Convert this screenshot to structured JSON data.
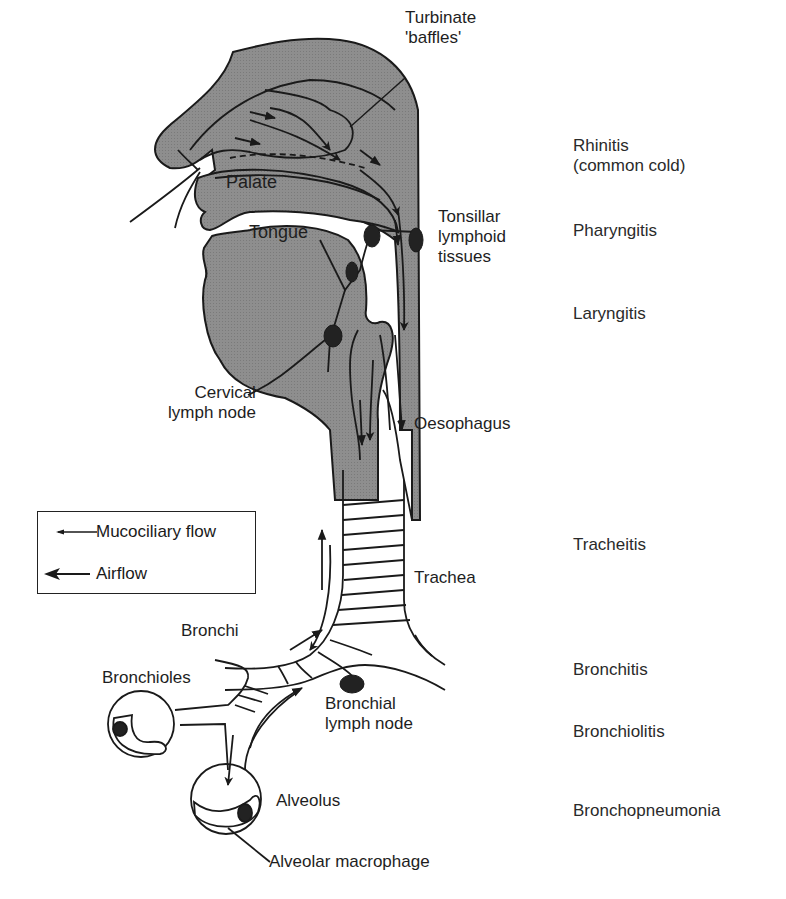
{
  "figure": {
    "type": "anatomical-diagram"
  },
  "colors": {
    "tissue_fill": "#8c8c8c",
    "line": "#1a1a1a",
    "background": "#ffffff",
    "lymph_node": "#222222"
  },
  "anatomy_labels": {
    "turbinate": "Turbinate\n'baffles'",
    "palate": "Palate",
    "tongue": "Tongue",
    "tonsillar": "Tonsillar\nlymphoid\ntissues",
    "cervical": "Cervical\nlymph node",
    "oesophagus": "Oesophagus",
    "trachea": "Trachea",
    "bronchi": "Bronchi",
    "bronchioles": "Bronchioles",
    "bronchial_node": "Bronchial\nlymph node",
    "alveolus": "Alveolus",
    "macrophage": "Alveolar macrophage"
  },
  "conditions": [
    {
      "label": "Rhinitis\n(common cold)"
    },
    {
      "label": "Pharyngitis"
    },
    {
      "label": "Laryngitis"
    },
    {
      "label": "Tracheitis"
    },
    {
      "label": "Bronchitis"
    },
    {
      "label": "Bronchiolitis"
    },
    {
      "label": "Bronchopneumonia"
    }
  ],
  "legend": {
    "items": [
      {
        "icon": "thin-arrow-left",
        "label": "Mucociliary flow"
      },
      {
        "icon": "thick-arrow-left",
        "label": "Airflow"
      }
    ]
  }
}
